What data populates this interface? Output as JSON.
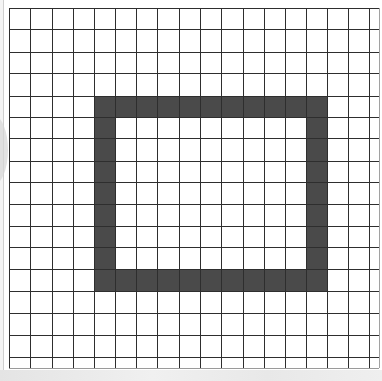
{
  "grid": {
    "columns": 17,
    "rows": 17,
    "x_lines": [
      9,
      30,
      52,
      73,
      94,
      115,
      136,
      157,
      179,
      200,
      221,
      243,
      264,
      285,
      306,
      327,
      348,
      369,
      379
    ],
    "y_lines": [
      8,
      29,
      52,
      73,
      96,
      117,
      138,
      161,
      182,
      204,
      226,
      247,
      269,
      291,
      313,
      335,
      357
    ],
    "bottom": 368,
    "line_color": "#2e2e2e"
  },
  "shape": {
    "description": "rectangular outline one cell thick",
    "color": "#4a4a4a",
    "outer": {
      "left": 94,
      "top": 96,
      "right": 327,
      "bottom": 291
    },
    "thickness_x": 21,
    "thickness_y": 21
  }
}
